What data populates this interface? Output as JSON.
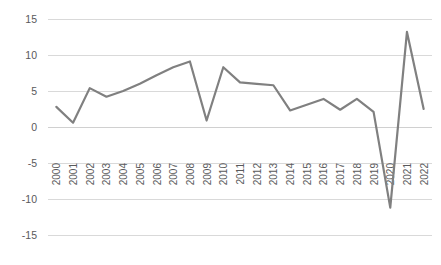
{
  "chart_data": {
    "type": "line",
    "title": "",
    "subtitle": "",
    "xlabel": "",
    "ylabel": "",
    "categories": [
      "2000",
      "2001",
      "2002",
      "2003",
      "2004",
      "2005",
      "2006",
      "2007",
      "2008",
      "2009",
      "2010",
      "2011",
      "2012",
      "2013",
      "2014",
      "2015",
      "2016",
      "2017",
      "2018",
      "2019",
      "2020",
      "2021",
      "2022"
    ],
    "series": [
      {
        "name": "Annual growth rate (%)",
        "color": "#808080",
        "values": [
          2.8,
          0.6,
          5.4,
          4.2,
          5.0,
          6.0,
          7.2,
          8.3,
          9.1,
          0.9,
          8.3,
          6.2,
          6.0,
          5.8,
          2.3,
          3.1,
          3.9,
          2.4,
          3.9,
          2.1,
          -11.2,
          13.2,
          2.5
        ]
      }
    ],
    "ylim": [
      -15,
      15
    ],
    "yticks": [
      15,
      10,
      5,
      0,
      -5,
      -10,
      -15
    ],
    "ytick_labels": [
      "15",
      "10",
      "5",
      "0",
      "-5",
      "-10",
      "-15"
    ],
    "xtick_labels": [
      "2000",
      "2001",
      "2002",
      "2003",
      "2004",
      "2005",
      "2006",
      "2007",
      "2008",
      "2009",
      "2010",
      "2011",
      "2012",
      "2013",
      "2014",
      "2015",
      "2016",
      "2017",
      "2018",
      "2019",
      "2020",
      "2021",
      "2022"
    ],
    "grid": true,
    "grid_axis": "y",
    "legend": false,
    "legend_position": "none",
    "markers": false,
    "annotations": []
  },
  "style": {
    "background": "#ffffff",
    "gridline_color": "#d9d9d9",
    "tick_label_color": "#59595b",
    "line_color": "#808080"
  },
  "layout": {
    "plot_left": 48,
    "plot_right": 432,
    "plot_top": 19,
    "plot_bottom": 235,
    "xlabel_rotation": -90
  }
}
